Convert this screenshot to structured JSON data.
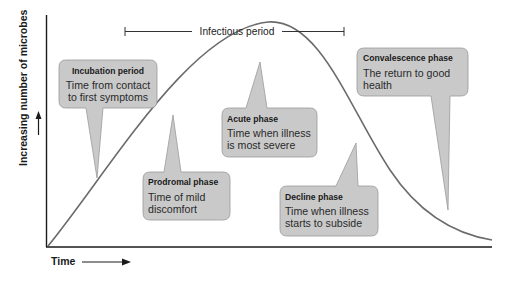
{
  "diagram": {
    "type": "disease-progression-curve",
    "axes": {
      "x_label": "Time",
      "y_label": "Increasing number of microbes"
    },
    "infectious_period": {
      "label": "Infectious period"
    },
    "phases": [
      {
        "id": "incubation",
        "title": "Incubation period",
        "line1": "Time from contact",
        "line2": "to first symptoms"
      },
      {
        "id": "prodromal",
        "title": "Prodromal phase",
        "line1": "Time of mild",
        "line2": "discomfort"
      },
      {
        "id": "acute",
        "title": "Acute phase",
        "line1": "Time when illness",
        "line2": "is most severe"
      },
      {
        "id": "decline",
        "title": "Decline phase",
        "line1": "Time when illness",
        "line2": "starts to subside"
      },
      {
        "id": "convalescence",
        "title": "Convalescence phase",
        "line1": "The return to good",
        "line2": "health"
      }
    ],
    "colors": {
      "bubble_fill": "#c9c9c9",
      "bubble_stroke": "#9a9a9a",
      "curve": "#6b6b6b",
      "axis": "#1a1a1a"
    }
  }
}
